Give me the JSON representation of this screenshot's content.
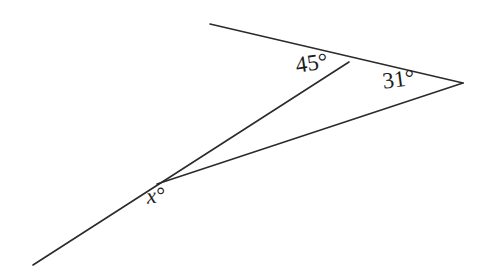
{
  "figure": {
    "kind": "geometry-angle-diagram",
    "background_color": "#ffffff",
    "stroke_color": "#2b2b2b",
    "label_color": "#1c1c1c",
    "stroke_width": 1.6
  },
  "labels": {
    "angle_top": "45°",
    "angle_right": "31°",
    "angle_unknown": "x°"
  },
  "geometry": {
    "points": {
      "transversal_end_bottom_left": [
        33,
        265
      ],
      "vertex_x": [
        157,
        184
      ],
      "vertex_45": [
        349,
        62
      ],
      "ray_end_top_left": [
        210,
        24
      ],
      "vertex_31": [
        463,
        83
      ]
    },
    "segments": [
      {
        "name": "transversal-through-x-to-45-vertex",
        "from": [
          33,
          265
        ],
        "to": [
          349,
          62
        ]
      },
      {
        "name": "top-ray-through-45-vertex-to-31-vertex",
        "from": [
          210,
          24
        ],
        "to": [
          463,
          83
        ]
      },
      {
        "name": "lower-ray-x-to-31-vertex",
        "from": [
          157,
          184
        ],
        "to": [
          463,
          83
        ]
      }
    ]
  }
}
